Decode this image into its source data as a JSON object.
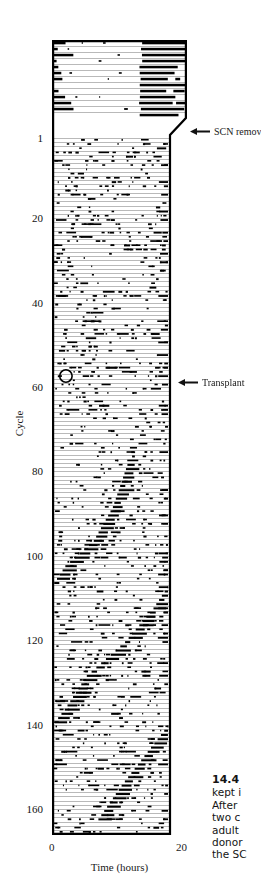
{
  "figure": {
    "title_number": "14.4",
    "caption_lines": [
      "kept i",
      "After ",
      "two c",
      "adult ",
      "donor",
      "the SC"
    ]
  },
  "axes": {
    "y": {
      "title": "Cycle",
      "ticks": [
        {
          "label": "1",
          "value": 1
        },
        {
          "label": "20",
          "value": 20
        },
        {
          "label": "40",
          "value": 40
        },
        {
          "label": "60",
          "value": 60
        },
        {
          "label": "80",
          "value": 80
        },
        {
          "label": "100",
          "value": 100
        },
        {
          "label": "120",
          "value": 120
        },
        {
          "label": "140",
          "value": 140
        },
        {
          "label": "160",
          "value": 160
        }
      ]
    },
    "x": {
      "title": "Time (hours)",
      "ticks": [
        {
          "label": "0",
          "value": 0
        },
        {
          "label": "20",
          "value": 20
        }
      ]
    }
  },
  "annotations": [
    {
      "id": "scn-removal",
      "label": "SCN removal",
      "arrow": "left-arrow-icon"
    },
    {
      "id": "transplant",
      "label": "Transplant",
      "arrow": "left-arrow-icon"
    }
  ],
  "colors": {
    "ink": "#000000",
    "background": "#ffffff",
    "raster_line": "#9a9a9a",
    "activity_bar": "#000000"
  },
  "chart_data": {
    "type": "actogram",
    "title": "",
    "xlabel": "Time (hours)",
    "ylabel": "Cycle",
    "xlim": [
      0,
      20
    ],
    "ylim": [
      0,
      168
    ],
    "grid": false,
    "legend": null,
    "notes": [
      "Double-plotted style raster of locomotor activity; each horizontal line is one cycle.",
      "Top block (cycles above 1) shows consolidated nocturnal activity bouts in the right half.",
      "After SCN removal activity becomes arrhythmic (scattered).",
      "After transplant near cycle 58 a free-running rhythm re-emerges as a drifting diagonal band."
    ],
    "markers": [
      {
        "name": "circle-marker",
        "cycle": 57,
        "hour": 2.4
      }
    ],
    "phase_band": {
      "description": "free-running activity onset drifting across cycles",
      "points": [
        {
          "cycle": 78,
          "hour": 13.0
        },
        {
          "cycle": 88,
          "hour": 10.5
        },
        {
          "cycle": 96,
          "hour": 7.2
        },
        {
          "cycle": 102,
          "hour": 2.3
        },
        {
          "cycle": 112,
          "hour": 17.5
        },
        {
          "cycle": 120,
          "hour": 12.6
        },
        {
          "cycle": 128,
          "hour": 6.0
        },
        {
          "cycle": 136,
          "hour": 2.2
        },
        {
          "cycle": 146,
          "hour": 16.5
        },
        {
          "cycle": 154,
          "hour": 12.0
        },
        {
          "cycle": 162,
          "hour": 8.0
        }
      ]
    },
    "segments": [
      {
        "name": "pre-lesion",
        "cycle_start": -12,
        "cycle_end": 0,
        "state": "entrained"
      },
      {
        "name": "post-lesion",
        "cycle_start": 1,
        "cycle_end": 57,
        "state": "arrhythmic"
      },
      {
        "name": "post-graft",
        "cycle_start": 58,
        "cycle_end": 168,
        "state": "free-running"
      }
    ]
  }
}
